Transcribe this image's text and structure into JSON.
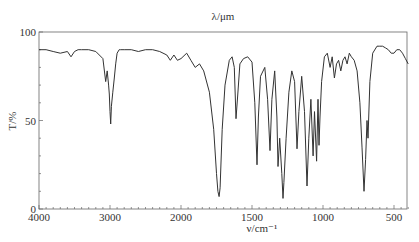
{
  "chart_data": {
    "type": "line",
    "title": "λ/μm",
    "xlabel": "ν/cm⁻¹",
    "ylabel": "T/%",
    "xlim": [
      4000,
      400
    ],
    "ylim": [
      0,
      100
    ],
    "x_scale_note": "scale expands ×2 below 2000 cm⁻¹",
    "x_ticks": [
      4000,
      3000,
      2000,
      1500,
      1000,
      500
    ],
    "y_ticks": [
      0,
      50,
      100
    ],
    "grid": false,
    "legend": null,
    "series": [
      {
        "name": "IR transmittance",
        "x": [
          4000,
          3900,
          3800,
          3700,
          3600,
          3550,
          3500,
          3450,
          3400,
          3300,
          3200,
          3100,
          3060,
          3040,
          3020,
          3010,
          3000,
          2990,
          2980,
          2960,
          2940,
          2920,
          2900,
          2870,
          2850,
          2800,
          2700,
          2600,
          2500,
          2400,
          2300,
          2200,
          2150,
          2100,
          2050,
          2000,
          1960,
          1930,
          1900,
          1870,
          1840,
          1800,
          1770,
          1750,
          1740,
          1732,
          1725,
          1710,
          1690,
          1660,
          1640,
          1625,
          1613,
          1600,
          1585,
          1560,
          1530,
          1500,
          1480,
          1465,
          1455,
          1440,
          1410,
          1390,
          1373,
          1360,
          1340,
          1325,
          1317,
          1305,
          1290,
          1282,
          1275,
          1260,
          1240,
          1220,
          1200,
          1183,
          1170,
          1150,
          1130,
          1113,
          1100,
          1085,
          1070,
          1060,
          1045,
          1035,
          1028,
          1021,
          1010,
          990,
          970,
          950,
          935,
          920,
          905,
          890,
          875,
          860,
          845,
          830,
          815,
          800,
          780,
          760,
          740,
          725,
          711,
          700,
          690,
          683,
          670,
          650,
          620,
          600,
          580,
          560,
          540,
          520,
          500,
          480,
          460,
          440,
          420,
          400
        ],
        "y": [
          90,
          90,
          89,
          88,
          89,
          86,
          89,
          90,
          90,
          90,
          89,
          85,
          72,
          78,
          70,
          65,
          55,
          48,
          58,
          66,
          74,
          82,
          88,
          90,
          90,
          90,
          90,
          89,
          90,
          90,
          89,
          87,
          84,
          87,
          84,
          85,
          88,
          84,
          80,
          82,
          78,
          66,
          45,
          20,
          10,
          7,
          12,
          45,
          70,
          84,
          86,
          80,
          51,
          65,
          82,
          85,
          86,
          83,
          60,
          25,
          52,
          75,
          80,
          62,
          33,
          62,
          78,
          52,
          24,
          40,
          20,
          6,
          15,
          40,
          66,
          78,
          72,
          34,
          55,
          75,
          55,
          13,
          40,
          62,
          30,
          55,
          27,
          62,
          36,
          52,
          72,
          86,
          88,
          80,
          86,
          74,
          82,
          84,
          78,
          84,
          86,
          82,
          88,
          86,
          84,
          78,
          60,
          35,
          10,
          28,
          50,
          40,
          72,
          88,
          92,
          92,
          92,
          91,
          90,
          88,
          88,
          90,
          90,
          88,
          85,
          82
        ]
      }
    ]
  }
}
